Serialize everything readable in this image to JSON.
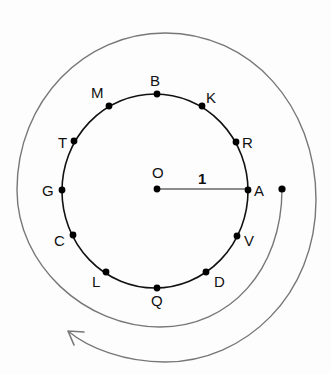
{
  "diagram": {
    "type": "unit-circle-with-spiral",
    "center": {
      "label": "O"
    },
    "radius_label": "1",
    "points": [
      {
        "label": "A",
        "angle_deg": 0
      },
      {
        "label": "R",
        "angle_deg": 30
      },
      {
        "label": "K",
        "angle_deg": 60
      },
      {
        "label": "B",
        "angle_deg": 90
      },
      {
        "label": "M",
        "angle_deg": 120
      },
      {
        "label": "T",
        "angle_deg": 150
      },
      {
        "label": "G",
        "angle_deg": 180
      },
      {
        "label": "C",
        "angle_deg": 210
      },
      {
        "label": "L",
        "angle_deg": 240
      },
      {
        "label": "Q",
        "angle_deg": 270
      },
      {
        "label": "D",
        "angle_deg": 300
      },
      {
        "label": "V",
        "angle_deg": 330
      }
    ],
    "spiral": {
      "direction": "clockwise",
      "start": "right of A",
      "turns": "about 1.4",
      "arrowhead": true
    },
    "colors": {
      "circle": "#111111",
      "spiral": "#777777",
      "points": "#000000"
    }
  }
}
